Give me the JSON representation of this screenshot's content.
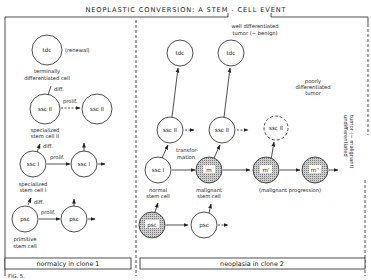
{
  "title": "NEOPLASTIC CONVERSION: A STEM - CELL EVENT",
  "colors": {
    "ink": "#222222",
    "malignant_fill": "#bdbdbd",
    "background": "#ffffff"
  },
  "left_panel": {
    "caption": "normalcy in clone 1",
    "cells": {
      "tdc": "tdc",
      "ssc2_a": "ssc II",
      "ssc2_b": "ssc II",
      "ssc1_a": "ssc I",
      "ssc1_b": "ssc I",
      "psc_a": "psc",
      "psc_b": "psc"
    },
    "labels": {
      "renewal": "(renewal)",
      "tdc_line1": "terminally",
      "tdc_line2": "differentiated cell",
      "ssc2_line1": "specialized",
      "ssc2_line2": "stem cell II",
      "ssc1_line1": "specialized",
      "ssc1_line2": "stem cell I",
      "psc_line1": "primitive",
      "psc_line2": "stem cell",
      "diff1": "diff.",
      "diff2": "diff.",
      "diff3": "diff.",
      "prolif1": "prolif.",
      "prolif2": "prolif.",
      "prolif3": "prolif."
    }
  },
  "right_panel": {
    "caption": "neoplasia in clone 2",
    "cells": {
      "tdc_a": "tdc",
      "tdc_b": "tdc",
      "ssc2_a": "ssc II",
      "ssc2_b": "ssc II",
      "ssc2_c": "ssc II",
      "ssc1": "ssc I",
      "m": "m",
      "m1": "m'",
      "m2": "m''",
      "psc_a": "psc",
      "psc_b": "psc"
    },
    "labels": {
      "well_line1": "well differentiated",
      "well_line2": "tumor (~ benign)",
      "poorly_line1": "poorly",
      "poorly_line2": "differentiated",
      "poorly_line3": "tumor",
      "transform_line1": "transfor-",
      "transform_line2": "mation",
      "normal_line1": "normal",
      "normal_line2": "stem cell",
      "malignant_line1": "malignant",
      "malignant_line2": "stem cell",
      "progression": "(malignant progression)",
      "undiff_line1": "undifferentiated",
      "undiff_line2": "tumor (~ malignant)"
    }
  },
  "figure_label": "FIG. 5."
}
